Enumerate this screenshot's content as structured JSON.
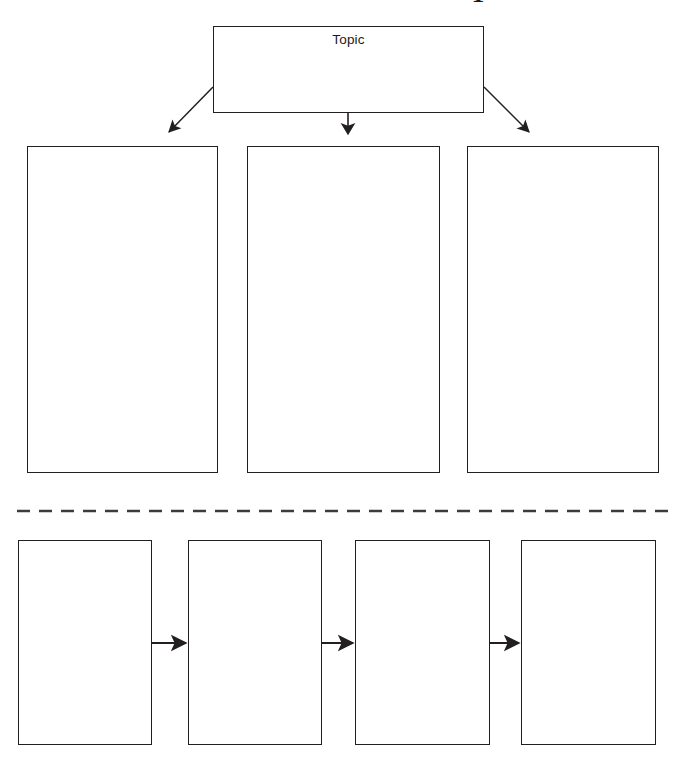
{
  "page": {
    "type": "graphic-organizer",
    "title_fragment": "T",
    "background_color": "#ffffff",
    "line_color": "#231f20",
    "text_color": "#1a1a1a",
    "width": 679,
    "height": 766
  },
  "topic": {
    "label": "Topic",
    "x": 213,
    "y": 26,
    "width": 271,
    "height": 87
  },
  "branches": {
    "count": 3,
    "boxes": [
      {
        "label": "",
        "x": 27,
        "y": 146,
        "width": 191,
        "height": 327
      },
      {
        "label": "",
        "x": 247,
        "y": 146,
        "width": 193,
        "height": 327
      },
      {
        "label": "",
        "x": 467,
        "y": 146,
        "width": 192,
        "height": 327
      }
    ],
    "connectors": [
      {
        "kind": "arrow-diagonal-left",
        "from_x": 213,
        "from_y": 87,
        "to_x": 168,
        "to_y": 133
      },
      {
        "kind": "arrow-down",
        "from_x": 348,
        "from_y": 113,
        "to_x": 348,
        "to_y": 136
      },
      {
        "kind": "arrow-diagonal-right",
        "from_x": 484,
        "from_y": 87,
        "to_x": 531,
        "to_y": 133
      }
    ]
  },
  "divider": {
    "kind": "dashed-line",
    "x_start": 17,
    "x_end": 668,
    "y": 511,
    "dash": 13,
    "gap": 9
  },
  "sequence": {
    "count": 4,
    "boxes": [
      {
        "label": "",
        "x": 18,
        "y": 540,
        "width": 134,
        "height": 205
      },
      {
        "label": "",
        "x": 188,
        "y": 540,
        "width": 134,
        "height": 205
      },
      {
        "label": "",
        "x": 355,
        "y": 540,
        "width": 135,
        "height": 205
      },
      {
        "label": "",
        "x": 521,
        "y": 540,
        "width": 135,
        "height": 205
      }
    ],
    "connectors": [
      {
        "kind": "arrow-right",
        "from_x": 152,
        "from_y": 643,
        "to_x": 188,
        "to_y": 643
      },
      {
        "kind": "arrow-right",
        "from_x": 322,
        "from_y": 643,
        "to_x": 355,
        "to_y": 643
      },
      {
        "kind": "arrow-right",
        "from_x": 490,
        "from_y": 643,
        "to_x": 521,
        "to_y": 643
      }
    ]
  }
}
